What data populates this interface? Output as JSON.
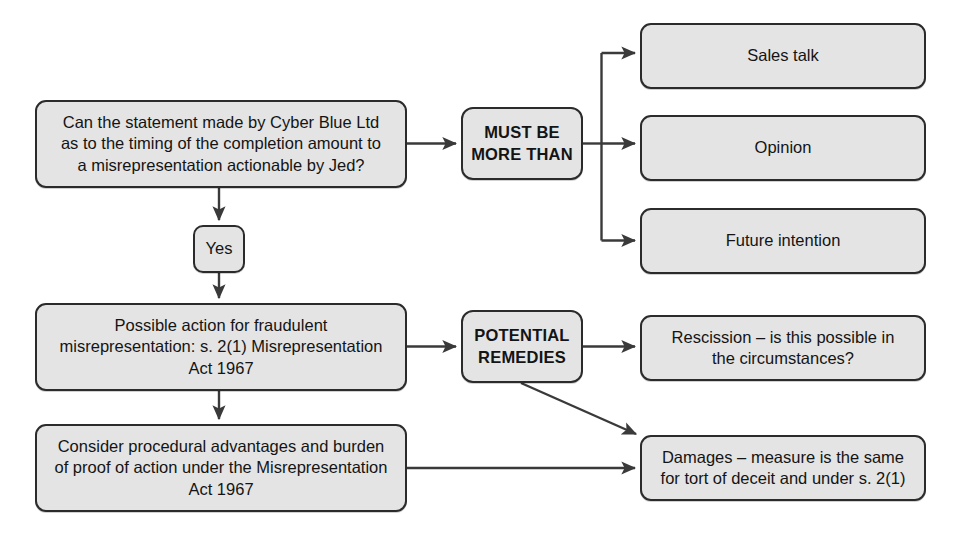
{
  "diagram": {
    "colors": {
      "node_fill": "#e4e4e4",
      "node_border": "#2b2b2b",
      "connector": "#3a3a3a",
      "text": "#141414",
      "background": "#ffffff"
    },
    "nodes": {
      "question": "Can the statement made by Cyber Blue Ltd\nas to the timing of the completion amount to\na misrepresentation actionable by Jed?",
      "must_be_more_than": "MUST BE\nMORE THAN",
      "sales_talk": "Sales talk",
      "opinion": "Opinion",
      "future_intention": "Future intention",
      "yes": "Yes",
      "possible_action": "Possible action for fraudulent\nmisrepresentation: s. 2(1) Misrepresentation\nAct 1967",
      "potential_remedies": "POTENTIAL\nREMEDIES",
      "rescission": "Rescission – is this possible in\nthe circumstances?",
      "consider_procedural": "Consider procedural advantages and burden\nof proof of action under the Misrepresentation\nAct 1967",
      "damages": "Damages – measure is the same\nfor tort of deceit and under s. 2(1)"
    },
    "edges": [
      {
        "from": "question",
        "to": "must_be_more_than",
        "label": ""
      },
      {
        "from": "must_be_more_than",
        "to": "sales_talk",
        "label": ""
      },
      {
        "from": "must_be_more_than",
        "to": "opinion",
        "label": ""
      },
      {
        "from": "must_be_more_than",
        "to": "future_intention",
        "label": ""
      },
      {
        "from": "question",
        "to": "yes",
        "label": ""
      },
      {
        "from": "yes",
        "to": "possible_action",
        "label": ""
      },
      {
        "from": "possible_action",
        "to": "potential_remedies",
        "label": ""
      },
      {
        "from": "potential_remedies",
        "to": "rescission",
        "label": ""
      },
      {
        "from": "potential_remedies",
        "to": "damages",
        "label": ""
      },
      {
        "from": "possible_action",
        "to": "consider_procedural",
        "label": ""
      },
      {
        "from": "consider_procedural",
        "to": "damages",
        "label": ""
      }
    ]
  }
}
